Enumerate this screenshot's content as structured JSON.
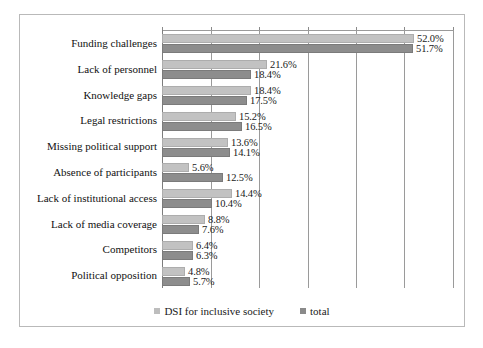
{
  "chart_data": {
    "type": "bar",
    "orientation": "horizontal",
    "title": "",
    "subtitle": "",
    "xlabel": "",
    "ylabel": "",
    "xlim": [
      0,
      60
    ],
    "x_tick_values": [
      0,
      10,
      20,
      30,
      40,
      50,
      60
    ],
    "grid": "vertical",
    "grid_visible": true,
    "axis_tick_labels_visible": false,
    "legend_position": "bottom-center",
    "categories": [
      "Funding challenges",
      "Lack of personnel",
      "Knowledge gaps",
      "Legal restrictions",
      "Missing political support",
      "Absence of participants",
      "Lack of institutional access",
      "Lack of media coverage",
      "Competitors",
      "Political opposition"
    ],
    "series": [
      {
        "name": "DSI for inclusive society",
        "color": "#c2c2c2",
        "values": [
          52.0,
          21.6,
          18.4,
          15.2,
          13.6,
          5.6,
          14.4,
          8.8,
          6.4,
          4.8
        ],
        "data_labels": [
          "52.0%",
          "21.6%",
          "18.4%",
          "15.2%",
          "13.6%",
          "5.6%",
          "14.4%",
          "8.8%",
          "6.4%",
          "4.8%"
        ]
      },
      {
        "name": "total",
        "color": "#8d8d8d",
        "values": [
          51.7,
          18.4,
          17.5,
          16.5,
          14.1,
          12.5,
          10.4,
          7.6,
          6.3,
          5.7
        ],
        "data_labels": [
          "51.7%",
          "18.4%",
          "17.5%",
          "16.5%",
          "14.1%",
          "12.5%",
          "10.4%",
          "7.6%",
          "6.3%",
          "5.7%"
        ]
      }
    ]
  }
}
